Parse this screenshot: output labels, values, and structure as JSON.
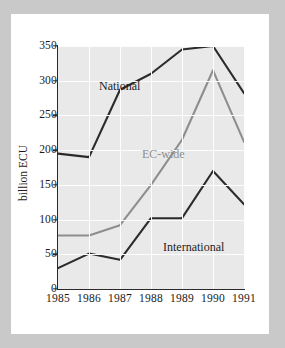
{
  "chart_data": {
    "type": "line",
    "title": "",
    "xlabel": "",
    "ylabel": "billion ECU",
    "categories": [
      "1985",
      "1986",
      "1987",
      "1988",
      "1989",
      "1990",
      "1991"
    ],
    "x": [
      1985,
      1986,
      1987,
      1988,
      1989,
      1990,
      1991
    ],
    "ylim": [
      0,
      350
    ],
    "yticks": [
      0,
      50,
      100,
      150,
      200,
      250,
      300,
      350
    ],
    "ytick_labels": [
      "0",
      "50",
      "100",
      "150",
      "200",
      "250",
      "300",
      "350"
    ],
    "grid": true,
    "legend_position": "inline-annotations",
    "series": [
      {
        "name": "National",
        "color": "#2b2b2b",
        "values": [
          195,
          190,
          287,
          310,
          345,
          350,
          282
        ]
      },
      {
        "name": "EC-wide",
        "color": "#8e8e8e",
        "values": [
          77,
          77,
          92,
          150,
          215,
          315,
          212
        ]
      },
      {
        "name": "International",
        "color": "#2b2b2b",
        "values": [
          30,
          51,
          42,
          102,
          102,
          170,
          122
        ]
      }
    ],
    "annotations": [
      {
        "text": "National",
        "series": "National"
      },
      {
        "text": "EC-wide",
        "series": "EC-wide"
      },
      {
        "text": "International",
        "series": "International"
      }
    ]
  },
  "colors": {
    "page_background": "#c9c9c9",
    "card_background": "#ffffff",
    "plot_background": "#e9e9e9",
    "gridline": "#fdfdfd",
    "axis": "#2a2a2a",
    "national_line": "#2b2b2b",
    "ecwide_line": "#8e8e8e",
    "international_line": "#2b2b2b",
    "tick_text": "#1a1a1a"
  }
}
